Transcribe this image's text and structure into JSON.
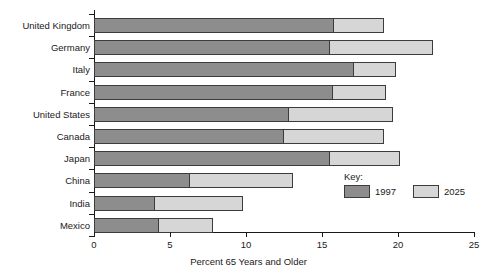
{
  "chart_data": {
    "type": "bar",
    "orientation": "horizontal",
    "stacked": false,
    "title": "",
    "xlabel": "Percent 65 Years and Older",
    "ylabel": "",
    "xlim": [
      0,
      25
    ],
    "xticks": [
      0,
      5,
      10,
      15,
      20,
      25
    ],
    "grid": false,
    "legend": {
      "title": "Key:",
      "position": "inside-lower-right",
      "entries": [
        {
          "name": "1997",
          "color": "#8d8d8d"
        },
        {
          "name": "2025",
          "color": "#d6d6d6"
        }
      ]
    },
    "categories": [
      "United Kingdom",
      "Germany",
      "Italy",
      "France",
      "United States",
      "Canada",
      "Japan",
      "China",
      "India",
      "Mexico"
    ],
    "series": [
      {
        "name": "1997",
        "color": "#8d8d8d",
        "values": [
          15.8,
          15.5,
          17.1,
          15.7,
          12.8,
          12.5,
          15.5,
          6.3,
          4.0,
          4.3
        ]
      },
      {
        "name": "2025",
        "color": "#d6d6d6",
        "values": [
          19.1,
          22.3,
          19.9,
          19.2,
          19.7,
          19.1,
          20.1,
          13.1,
          9.8,
          7.8
        ]
      }
    ]
  },
  "colors": {
    "series_1997": "#8d8d8d",
    "series_2025": "#d6d6d6",
    "axis": "#1a1a1a",
    "bar_outline": "#3c3c3c",
    "background": "#ffffff"
  }
}
